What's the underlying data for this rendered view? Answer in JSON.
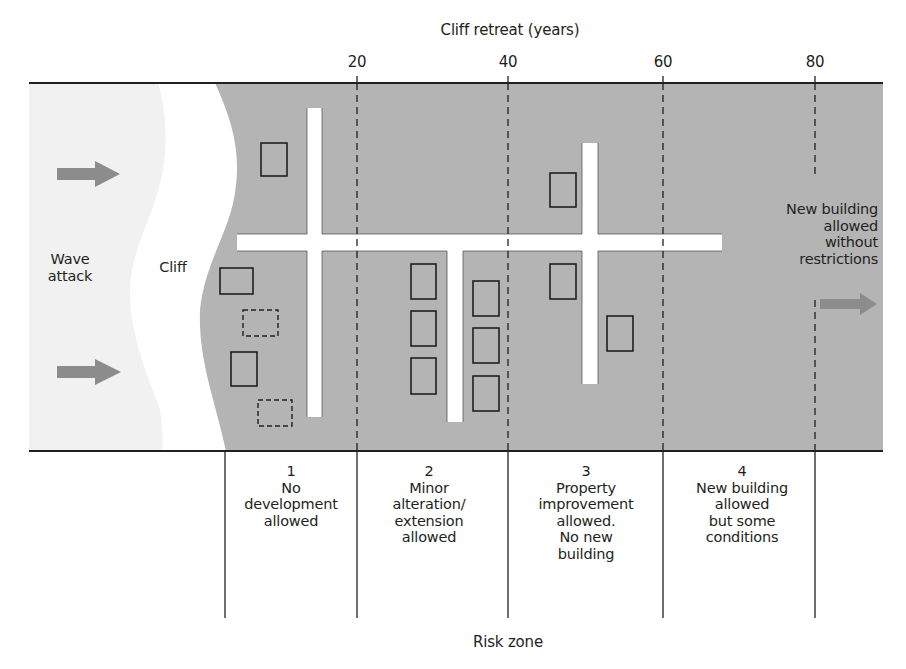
{
  "axis": {
    "title": "Cliff retreat (years)",
    "ticks": [
      {
        "value": "20",
        "x": 357
      },
      {
        "value": "40",
        "x": 508
      },
      {
        "value": "60",
        "x": 663
      },
      {
        "value": "80",
        "x": 815
      }
    ]
  },
  "labels": {
    "wave_attack": "Wave attack",
    "wave_attack_line1": "Wave",
    "wave_attack_line2": "attack",
    "cliff": "Cliff",
    "right_note_line1": "New building",
    "right_note_line2": "allowed",
    "right_note_line3": "without",
    "right_note_line4": "restrictions",
    "footer": "Risk zone"
  },
  "zones": [
    {
      "number": "1",
      "lines": [
        "No",
        "development",
        "allowed"
      ]
    },
    {
      "number": "2",
      "lines": [
        "Minor",
        "alteration/",
        "extension",
        "allowed"
      ]
    },
    {
      "number": "3",
      "lines": [
        "Property",
        "improvement",
        "allowed.",
        "No new",
        "building"
      ]
    },
    {
      "number": "4",
      "lines": [
        "New building",
        "allowed",
        "but some",
        "conditions"
      ]
    }
  ],
  "colors": {
    "land": "#b4b4b4",
    "sea": "#f1f1f1",
    "cliff": "#ffffff",
    "road": "#ffffff",
    "arrow": "#8c8c8c",
    "line": "#231f20"
  },
  "buildings": {
    "existing": [
      {
        "x": 261,
        "y": 143,
        "w": 26,
        "h": 33
      },
      {
        "x": 220,
        "y": 268,
        "w": 33,
        "h": 26
      },
      {
        "x": 231,
        "y": 352,
        "w": 26,
        "h": 34
      },
      {
        "x": 411,
        "y": 264,
        "w": 25,
        "h": 35
      },
      {
        "x": 411,
        "y": 311,
        "w": 25,
        "h": 35
      },
      {
        "x": 411,
        "y": 358,
        "w": 25,
        "h": 36
      },
      {
        "x": 473,
        "y": 281,
        "w": 26,
        "h": 35
      },
      {
        "x": 473,
        "y": 328,
        "w": 26,
        "h": 35
      },
      {
        "x": 473,
        "y": 376,
        "w": 26,
        "h": 35
      },
      {
        "x": 550,
        "y": 173,
        "w": 26,
        "h": 34
      },
      {
        "x": 550,
        "y": 264,
        "w": 26,
        "h": 35
      },
      {
        "x": 607,
        "y": 316,
        "w": 26,
        "h": 35
      }
    ],
    "lost": [
      {
        "x": 243,
        "y": 310,
        "w": 35,
        "h": 26
      },
      {
        "x": 258,
        "y": 400,
        "w": 34,
        "h": 26
      }
    ]
  }
}
